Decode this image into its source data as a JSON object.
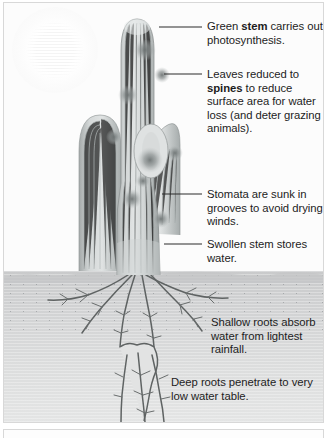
{
  "figure": {
    "scene": {
      "sun_icon": "sun-glow",
      "sky_label": "above-ground",
      "soil_label": "below-ground",
      "ground_line_y": 272
    },
    "colors": {
      "text": "#1d1d1d",
      "leader_line": "#2b2b2b",
      "plant_light": "#d9dcdc",
      "plant_mid": "#b9bdbd",
      "plant_dark": "#9aa0a0",
      "spine_cluster": "#8a9090",
      "soil_top": "#c9cacb",
      "soil_bottom": "#e4e5e5",
      "root": "#5c6060",
      "panel_border": "#d8d8d8",
      "background": "#ffffff"
    }
  },
  "annotations": [
    {
      "id": "green-stem",
      "leader": {
        "x1": 155,
        "y1": 24,
        "x2": 198,
        "y2": 24
      },
      "text_runs": [
        {
          "text": "Green ",
          "bold": false
        },
        {
          "text": "stem",
          "bold": true
        },
        {
          "text": " carries out photosynthesis.",
          "bold": false
        }
      ],
      "plain_text": "Green stem carries out photosynthesis."
    },
    {
      "id": "leaves-reduced-to-spines",
      "leader": {
        "x1": 160,
        "y1": 71,
        "x2": 198,
        "y2": 71
      },
      "text_runs": [
        {
          "text": "Leaves reduced to ",
          "bold": false
        },
        {
          "text": "spines",
          "bold": true
        },
        {
          "text": " to reduce surface area for water loss (and deter grazing animals).",
          "bold": false
        }
      ],
      "plain_text": "Leaves reduced to spines to reduce surface area for water loss (and deter grazing animals)."
    },
    {
      "id": "stomata-sunk-in-grooves",
      "leader": {
        "x1": 158,
        "y1": 191,
        "x2": 198,
        "y2": 191
      },
      "text_runs": [
        {
          "text": "Stomata are sunk in grooves to avoid drying winds.",
          "bold": false
        }
      ],
      "plain_text": "Stomata are sunk in grooves to avoid drying winds."
    },
    {
      "id": "swollen-stem-stores-water",
      "leader": {
        "x1": 160,
        "y1": 241,
        "x2": 198,
        "y2": 241
      },
      "text_runs": [
        {
          "text": "Swollen stem stores water.",
          "bold": false
        }
      ],
      "plain_text": "Swollen stem stores water."
    },
    {
      "id": "shallow-roots",
      "leader": null,
      "text_runs": [
        {
          "text": "Shallow roots absorb water from lightest rainfall.",
          "bold": false
        }
      ],
      "plain_text": "Shallow roots absorb water from lightest rainfall."
    },
    {
      "id": "deep-roots",
      "leader": null,
      "text_runs": [
        {
          "text": "Deep roots penetrate to very low water table.",
          "bold": false
        }
      ],
      "plain_text": "Deep roots penetrate to very low water table."
    }
  ]
}
